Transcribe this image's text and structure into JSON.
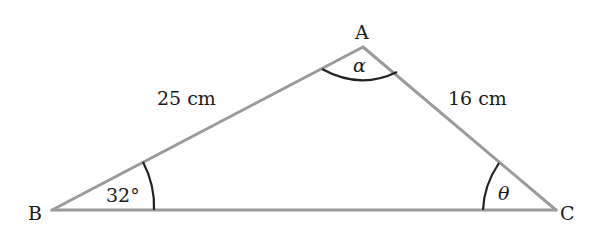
{
  "diagram": {
    "type": "triangle",
    "colors": {
      "edge": "#9a9a9a",
      "arc": "#222222",
      "text": "#1a1a1a",
      "background": "#ffffff"
    },
    "vertices": {
      "A": {
        "label": "A",
        "x": 363,
        "y": 47
      },
      "B": {
        "label": "B",
        "x": 52,
        "y": 210
      },
      "C": {
        "label": "C",
        "x": 556,
        "y": 210
      }
    },
    "sides": {
      "AB": {
        "label": "25 cm"
      },
      "AC": {
        "label": "16 cm"
      }
    },
    "angles": {
      "A": {
        "label": "α"
      },
      "B": {
        "label": "32°"
      },
      "C": {
        "label": "θ"
      }
    }
  }
}
